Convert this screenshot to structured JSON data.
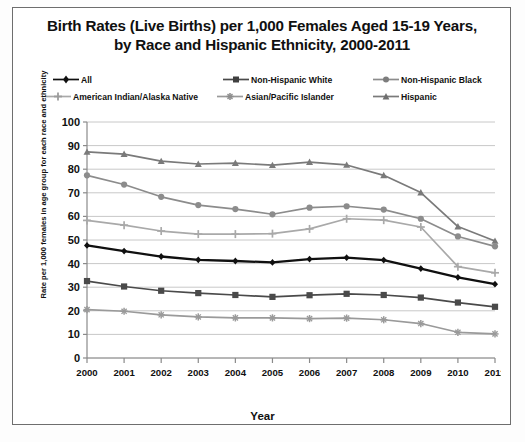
{
  "chart_data": {
    "type": "line",
    "title": "Birth Rates (Live Births) per 1,000 Females Aged 15-19 Years, by Race and Hispanic Ethnicity, 2000-2011",
    "title_line1": "Birth Rates (Live Births) per 1,000 Females Aged 15-19 Years,",
    "title_line2": "by Race and Hispanic Ethnicity, 2000-2011",
    "xlabel": "Year",
    "ylabel": "Rate per 1,000 females in age group for each race and ethnicity",
    "categories": [
      "2000",
      "2001",
      "2002",
      "2003",
      "2004",
      "2005",
      "2006",
      "2007",
      "2008",
      "2009",
      "2010",
      "2011"
    ],
    "x": [
      2000,
      2001,
      2002,
      2003,
      2004,
      2005,
      2006,
      2007,
      2008,
      2009,
      2010,
      2011
    ],
    "ylim": [
      0,
      100
    ],
    "yticks": [
      "0",
      "10",
      "20",
      "30",
      "40",
      "50",
      "60",
      "70",
      "80",
      "90",
      "100"
    ],
    "ytick_values": [
      0,
      10,
      20,
      30,
      40,
      50,
      60,
      70,
      80,
      90,
      100
    ],
    "grid": true,
    "legend_position": "top",
    "series": [
      {
        "name": "All",
        "color": "#101010",
        "marker": "diamond",
        "values": [
          47.7,
          45.3,
          43.0,
          41.6,
          41.1,
          40.5,
          41.9,
          42.5,
          41.5,
          37.9,
          34.2,
          31.3
        ]
      },
      {
        "name": "Non-Hispanic White",
        "color": "#4a4a4a",
        "marker": "square",
        "values": [
          32.6,
          30.3,
          28.5,
          27.5,
          26.7,
          25.9,
          26.6,
          27.2,
          26.7,
          25.6,
          23.5,
          21.7
        ]
      },
      {
        "name": "Non-Hispanic Black",
        "color": "#8c8c8c",
        "marker": "circle",
        "values": [
          77.4,
          73.5,
          68.3,
          64.8,
          63.1,
          60.9,
          63.7,
          64.3,
          62.9,
          59.0,
          51.5,
          47.3
        ]
      },
      {
        "name": "American Indian/Alaska Native",
        "color": "#a9a9a9",
        "marker": "plus",
        "values": [
          58.3,
          56.3,
          53.8,
          52.5,
          52.5,
          52.7,
          54.7,
          59.0,
          58.4,
          55.5,
          38.7,
          36.1
        ]
      },
      {
        "name": "Asian/Pacific Islander",
        "color": "#9a9a9a",
        "marker": "star",
        "values": [
          20.5,
          19.8,
          18.3,
          17.4,
          17.0,
          17.0,
          16.7,
          16.9,
          16.2,
          14.6,
          10.9,
          10.2
        ]
      },
      {
        "name": "Hispanic",
        "color": "#7a7a7a",
        "marker": "triangle",
        "values": [
          87.3,
          86.4,
          83.4,
          82.2,
          82.6,
          81.7,
          83.0,
          81.8,
          77.4,
          70.1,
          55.7,
          49.6
        ]
      }
    ]
  },
  "chart": {
    "title_line1": "Birth Rates (Live Births) per 1,000 Females Aged 15-19 Years,",
    "title_line2": "by Race and Hispanic Ethnicity, 2000-2011",
    "xlabel": "Year",
    "ylabel": "Rate per 1,000 females in age group for each race and ethnicity"
  },
  "legend": {
    "items": [
      {
        "label": "All",
        "marker": "diamond-marker-icon"
      },
      {
        "label": "Non-Hispanic White",
        "marker": "square-marker-icon"
      },
      {
        "label": "Non-Hispanic Black",
        "marker": "circle-marker-icon"
      },
      {
        "label": "American Indian/Alaska Native",
        "marker": "plus-marker-icon"
      },
      {
        "label": "Asian/Pacific Islander",
        "marker": "star-marker-icon"
      },
      {
        "label": "Hispanic",
        "marker": "triangle-marker-icon"
      }
    ]
  },
  "caption": ""
}
